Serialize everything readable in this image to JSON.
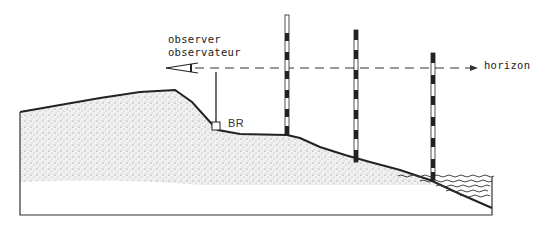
{
  "diagram": {
    "type": "surveying-cross-section",
    "labels": {
      "observer_en": "observer",
      "observer_fr": "observateur",
      "horizon": "horizon",
      "benchmark": "BR"
    },
    "elements": [
      "terrain-profile",
      "observer-eye",
      "instrument-staff",
      "benchmark-box",
      "leveling-rod-1",
      "leveling-rod-2",
      "leveling-rod-3",
      "horizon-line",
      "water-body"
    ],
    "colors": {
      "line": "#222222",
      "ground_stipple": "#888888",
      "background": "#ffffff"
    }
  }
}
